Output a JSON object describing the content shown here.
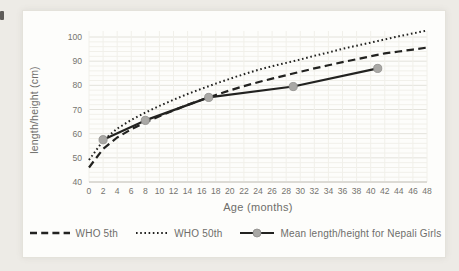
{
  "figure": {
    "background": "#edebe6",
    "panel_background": "#fdfdfb",
    "text_color": "#6e6d6a",
    "line_color": "#222220",
    "marker_fill": "#a9a8a5",
    "marker_edge": "#8e8d8a",
    "grid_minor_color": "#f1f0ea",
    "grid_major_color": "#e3e2db",
    "axis_line_color": "#c7c6c0"
  },
  "chart_data": {
    "type": "line",
    "title": "",
    "xlabel": "Age (months)",
    "ylabel": "length/height (cm)",
    "xlim": [
      0,
      48
    ],
    "ylim": [
      40,
      100
    ],
    "x_ticks": [
      0,
      2,
      4,
      6,
      8,
      10,
      12,
      14,
      16,
      18,
      20,
      22,
      24,
      26,
      28,
      30,
      32,
      34,
      36,
      38,
      40,
      42,
      44,
      46,
      48
    ],
    "y_ticks": [
      40,
      50,
      60,
      70,
      80,
      90,
      100
    ],
    "grid": true,
    "legend_position": "bottom",
    "series": [
      {
        "name": "WHO 5th",
        "style": "dashed",
        "x": [
          0,
          2,
          4,
          6,
          8,
          10,
          12,
          14,
          16,
          18,
          20,
          22,
          24,
          26,
          28,
          30,
          32,
          34,
          36,
          38,
          40,
          42,
          44,
          46,
          48
        ],
        "y": [
          46.0,
          53.7,
          58.4,
          61.8,
          64.7,
          67.2,
          69.6,
          71.9,
          74.0,
          76.0,
          77.9,
          79.7,
          81.3,
          82.8,
          84.2,
          85.6,
          87.0,
          88.3,
          89.6,
          90.8,
          92.0,
          93.2,
          94.0,
          94.8,
          95.6
        ]
      },
      {
        "name": "WHO 50th",
        "style": "dotted",
        "x": [
          0,
          2,
          4,
          6,
          8,
          10,
          12,
          14,
          16,
          18,
          20,
          22,
          24,
          26,
          28,
          30,
          32,
          34,
          36,
          38,
          40,
          42,
          44,
          46,
          48
        ],
        "y": [
          49.1,
          57.1,
          62.1,
          65.7,
          68.7,
          71.5,
          74.0,
          76.4,
          78.6,
          80.7,
          82.7,
          84.6,
          86.4,
          87.9,
          89.3,
          90.7,
          92.2,
          93.6,
          95.1,
          96.4,
          97.7,
          99.0,
          100.3,
          101.5,
          102.7
        ]
      },
      {
        "name": "Mean length/height for Nepali Girls",
        "style": "solid-marker",
        "x": [
          2,
          8,
          17,
          29,
          41
        ],
        "y": [
          57.5,
          65.5,
          75.0,
          79.5,
          87.0
        ]
      }
    ]
  }
}
